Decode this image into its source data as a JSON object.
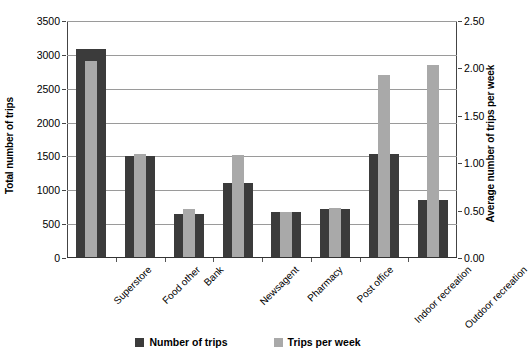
{
  "chart_data": {
    "type": "bar",
    "title": "",
    "subtitle": "",
    "xlabel": "",
    "ylabel": "Total number of trips",
    "y2label": "Average number of trips per week",
    "grid": true,
    "legend_position": "bottom",
    "categories": [
      "Superstore",
      "Food other",
      "Bank",
      "Newsagent",
      "Pharmacy",
      "Post office",
      "Indoor recreation",
      "Outdoor recreation"
    ],
    "ylim": [
      0,
      3500
    ],
    "y2lim": [
      0,
      2.5
    ],
    "yticks": [
      "0",
      "500",
      "1000",
      "1500",
      "2000",
      "2500",
      "3000",
      "3500"
    ],
    "y2ticks": [
      "0.00",
      "0.50",
      "1.00",
      "1.50",
      "2.00",
      "2.50"
    ],
    "series": [
      {
        "name": "Number of trips",
        "axis": "left",
        "color": "#3b3b3b",
        "values": [
          3080,
          1510,
          645,
          1105,
          680,
          720,
          1530,
          860
        ]
      },
      {
        "name": "Trips per week",
        "axis": "right",
        "color": "#a9a9a9",
        "values": [
          2.08,
          1.1,
          0.52,
          1.09,
          0.49,
          0.53,
          1.93,
          2.04
        ]
      }
    ]
  },
  "legend": {
    "items": [
      {
        "label": "Number of trips",
        "color": "#3b3b3b"
      },
      {
        "label": "Trips per week",
        "color": "#a9a9a9"
      }
    ]
  }
}
